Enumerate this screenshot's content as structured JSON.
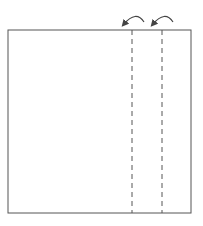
{
  "diagram": {
    "colors": {
      "stroke": "#444444",
      "background": "#ffffff"
    },
    "square": {
      "x": 8,
      "y": 30,
      "width": 183,
      "height": 183
    },
    "fold_lines": [
      {
        "x": 132,
        "style": "dashed"
      },
      {
        "x": 162,
        "style": "dashed"
      }
    ],
    "arrows": [
      {
        "from_x": 144,
        "to_x": 123,
        "direction": "left"
      },
      {
        "from_x": 173,
        "to_x": 152,
        "direction": "left"
      }
    ]
  }
}
